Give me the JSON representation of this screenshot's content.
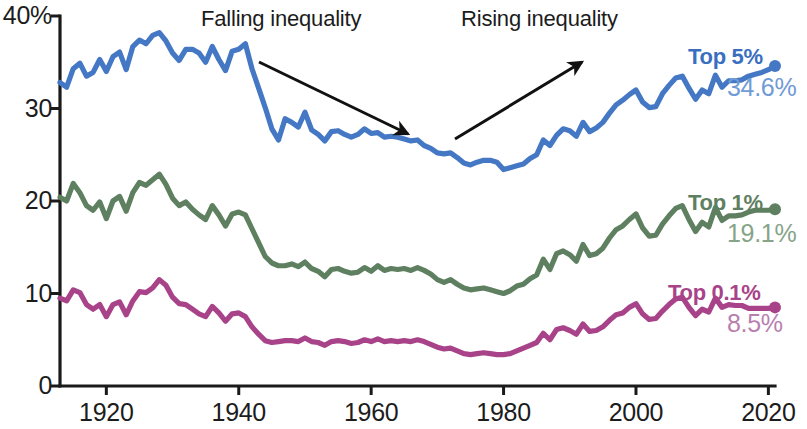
{
  "chart_data": {
    "type": "line",
    "title": "",
    "xlabel": "",
    "ylabel": "",
    "xlim": [
      1913,
      2021
    ],
    "ylim": [
      0,
      40
    ],
    "grid": false,
    "legend_position": "right-inline",
    "x_ticks": [
      "1920",
      "1940",
      "1960",
      "1980",
      "2000",
      "2020"
    ],
    "x_tick_values": [
      1920,
      1940,
      1960,
      1980,
      2000,
      2020
    ],
    "y_ticks": [
      "40%",
      "30",
      "20",
      "10",
      "0"
    ],
    "y_tick_values": [
      40,
      30,
      20,
      10,
      0
    ],
    "annotations": [
      {
        "text": "Falling inequality",
        "arrow": "down-right"
      },
      {
        "text": "Rising inequality",
        "arrow": "up-right"
      }
    ],
    "series": [
      {
        "name": "Top 5%",
        "color": "#4478c4",
        "end_label": "34.6%",
        "end_value": 34.6,
        "x": [
          1913,
          1914,
          1915,
          1916,
          1917,
          1918,
          1919,
          1920,
          1921,
          1922,
          1923,
          1924,
          1925,
          1926,
          1927,
          1928,
          1929,
          1930,
          1931,
          1932,
          1933,
          1934,
          1935,
          1936,
          1937,
          1938,
          1939,
          1940,
          1941,
          1942,
          1943,
          1944,
          1945,
          1946,
          1947,
          1948,
          1949,
          1950,
          1951,
          1952,
          1953,
          1954,
          1955,
          1956,
          1957,
          1958,
          1959,
          1960,
          1961,
          1962,
          1963,
          1964,
          1965,
          1966,
          1967,
          1968,
          1969,
          1970,
          1971,
          1972,
          1973,
          1974,
          1975,
          1976,
          1977,
          1978,
          1979,
          1980,
          1981,
          1982,
          1983,
          1984,
          1985,
          1986,
          1987,
          1988,
          1989,
          1990,
          1991,
          1992,
          1993,
          1994,
          1995,
          1996,
          1997,
          1998,
          1999,
          2000,
          2001,
          2002,
          2003,
          2004,
          2005,
          2006,
          2007,
          2008,
          2009,
          2010,
          2011,
          2012,
          2013,
          2014,
          2015,
          2016,
          2017,
          2018,
          2019,
          2020,
          2021
        ],
        "values": [
          32.8,
          32.3,
          34.3,
          34.9,
          33.5,
          33.9,
          35.3,
          34.0,
          35.6,
          36.1,
          34.2,
          36.7,
          37.4,
          37.0,
          37.9,
          38.2,
          37.3,
          36.0,
          35.2,
          36.4,
          36.4,
          36.0,
          35.0,
          36.7,
          35.3,
          34.1,
          36.2,
          36.4,
          37.0,
          34.3,
          32.2,
          30.1,
          27.8,
          26.6,
          28.9,
          28.5,
          28.0,
          29.6,
          27.7,
          27.2,
          26.5,
          27.5,
          27.6,
          27.2,
          26.9,
          27.2,
          27.8,
          27.3,
          27.4,
          26.9,
          27.0,
          26.9,
          26.7,
          26.5,
          26.6,
          26.0,
          25.7,
          25.2,
          25.1,
          25.2,
          24.7,
          24.1,
          23.9,
          24.2,
          24.4,
          24.4,
          24.2,
          23.4,
          23.6,
          23.8,
          24.0,
          24.6,
          25.0,
          26.6,
          26.0,
          27.1,
          27.8,
          27.6,
          27.0,
          28.5,
          27.5,
          27.9,
          28.5,
          29.5,
          30.4,
          30.9,
          31.5,
          32.0,
          30.7,
          30.1,
          30.2,
          31.6,
          32.5,
          33.3,
          33.5,
          32.2,
          31.0,
          32.0,
          31.6,
          33.6,
          32.3,
          33.0,
          33.0,
          33.1,
          33.5,
          33.7,
          33.9,
          34.2,
          34.6
        ]
      },
      {
        "name": "Top 1%",
        "color": "#5e8060",
        "end_label": "19.1%",
        "end_value": 19.1,
        "x": [
          1913,
          1914,
          1915,
          1916,
          1917,
          1918,
          1919,
          1920,
          1921,
          1922,
          1923,
          1924,
          1925,
          1926,
          1927,
          1928,
          1929,
          1930,
          1931,
          1932,
          1933,
          1934,
          1935,
          1936,
          1937,
          1938,
          1939,
          1940,
          1941,
          1942,
          1943,
          1944,
          1945,
          1946,
          1947,
          1948,
          1949,
          1950,
          1951,
          1952,
          1953,
          1954,
          1955,
          1956,
          1957,
          1958,
          1959,
          1960,
          1961,
          1962,
          1963,
          1964,
          1965,
          1966,
          1967,
          1968,
          1969,
          1970,
          1971,
          1972,
          1973,
          1974,
          1975,
          1976,
          1977,
          1978,
          1979,
          1980,
          1981,
          1982,
          1983,
          1984,
          1985,
          1986,
          1987,
          1988,
          1989,
          1990,
          1991,
          1992,
          1993,
          1994,
          1995,
          1996,
          1997,
          1998,
          1999,
          2000,
          2001,
          2002,
          2003,
          2004,
          2005,
          2006,
          2007,
          2008,
          2009,
          2010,
          2011,
          2012,
          2013,
          2014,
          2015,
          2016,
          2017,
          2018,
          2019,
          2020,
          2021
        ],
        "values": [
          20.4,
          20.0,
          21.9,
          20.9,
          19.5,
          19.0,
          19.9,
          18.1,
          20.0,
          20.5,
          18.9,
          20.9,
          22.0,
          21.7,
          22.3,
          22.9,
          21.8,
          20.3,
          19.5,
          19.9,
          19.1,
          18.5,
          18.0,
          19.5,
          18.5,
          17.3,
          18.6,
          18.8,
          18.5,
          17.0,
          15.5,
          14.0,
          13.3,
          13.0,
          13.0,
          13.2,
          12.9,
          13.4,
          12.7,
          12.4,
          11.8,
          12.6,
          12.7,
          12.4,
          12.2,
          12.3,
          12.8,
          12.4,
          13.0,
          12.5,
          12.7,
          12.6,
          12.7,
          12.5,
          12.8,
          12.5,
          12.1,
          11.5,
          11.2,
          11.5,
          11.0,
          10.6,
          10.4,
          10.5,
          10.6,
          10.4,
          10.2,
          10.0,
          10.3,
          10.8,
          11.0,
          11.6,
          12.0,
          13.7,
          12.6,
          14.3,
          14.6,
          14.2,
          13.5,
          15.3,
          14.1,
          14.3,
          14.9,
          16.0,
          16.9,
          17.3,
          18.0,
          18.6,
          17.1,
          16.2,
          16.3,
          17.5,
          18.4,
          19.2,
          19.5,
          18.0,
          16.7,
          17.7,
          17.2,
          19.3,
          17.9,
          18.4,
          18.4,
          18.5,
          18.8,
          19.0,
          19.0,
          19.0,
          19.1
        ]
      },
      {
        "name": "Top 0.1%",
        "color": "#a8438a",
        "end_label": "8.5%",
        "end_value": 8.5,
        "x": [
          1913,
          1914,
          1915,
          1916,
          1917,
          1918,
          1919,
          1920,
          1921,
          1922,
          1923,
          1924,
          1925,
          1926,
          1927,
          1928,
          1929,
          1930,
          1931,
          1932,
          1933,
          1934,
          1935,
          1936,
          1937,
          1938,
          1939,
          1940,
          1941,
          1942,
          1943,
          1944,
          1945,
          1946,
          1947,
          1948,
          1949,
          1950,
          1951,
          1952,
          1953,
          1954,
          1955,
          1956,
          1957,
          1958,
          1959,
          1960,
          1961,
          1962,
          1963,
          1964,
          1965,
          1966,
          1967,
          1968,
          1969,
          1970,
          1971,
          1972,
          1973,
          1974,
          1975,
          1976,
          1977,
          1978,
          1979,
          1980,
          1981,
          1982,
          1983,
          1984,
          1985,
          1986,
          1987,
          1988,
          1989,
          1990,
          1991,
          1992,
          1993,
          1994,
          1995,
          1996,
          1997,
          1998,
          1999,
          2000,
          2001,
          2002,
          2003,
          2004,
          2005,
          2006,
          2007,
          2008,
          2009,
          2010,
          2011,
          2012,
          2013,
          2014,
          2015,
          2016,
          2017,
          2018,
          2019,
          2020,
          2021
        ],
        "values": [
          9.5,
          9.2,
          10.4,
          10.1,
          8.8,
          8.3,
          8.8,
          7.5,
          8.8,
          9.1,
          7.7,
          9.2,
          10.2,
          10.1,
          10.6,
          11.5,
          10.9,
          9.6,
          8.9,
          8.8,
          8.3,
          7.8,
          7.5,
          8.6,
          7.9,
          7.0,
          7.8,
          7.9,
          7.5,
          6.4,
          5.6,
          4.9,
          4.7,
          4.8,
          4.9,
          4.9,
          4.8,
          5.2,
          4.8,
          4.7,
          4.4,
          4.8,
          4.9,
          4.8,
          4.6,
          4.7,
          5.0,
          4.8,
          5.1,
          4.8,
          4.9,
          4.8,
          4.9,
          4.8,
          5.0,
          4.8,
          4.5,
          4.2,
          4.0,
          4.1,
          3.8,
          3.5,
          3.4,
          3.5,
          3.6,
          3.5,
          3.4,
          3.4,
          3.5,
          3.8,
          4.1,
          4.4,
          4.7,
          5.7,
          5.0,
          6.1,
          6.3,
          6.0,
          5.6,
          6.7,
          5.9,
          6.0,
          6.4,
          7.1,
          7.7,
          7.9,
          8.5,
          8.9,
          7.8,
          7.2,
          7.3,
          8.1,
          8.8,
          9.4,
          9.6,
          8.5,
          7.6,
          8.3,
          8.0,
          9.5,
          8.5,
          8.8,
          8.7,
          8.7,
          8.4,
          8.4,
          8.4,
          8.4,
          8.5
        ]
      }
    ]
  },
  "axes": {
    "y_axis_name": "y-axis",
    "x_axis_name": "x-axis"
  }
}
